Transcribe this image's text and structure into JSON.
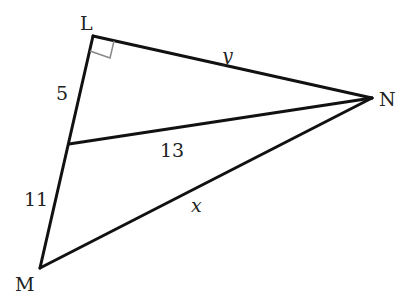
{
  "diagram": {
    "type": "geometry-triangle",
    "vertices": {
      "L": {
        "label": "L",
        "x": 93,
        "y": 36
      },
      "M": {
        "label": "M",
        "x": 40,
        "y": 268
      },
      "N": {
        "label": "N",
        "x": 372,
        "y": 98
      }
    },
    "segments": [
      {
        "from": "L",
        "to": "N",
        "label": "y"
      },
      {
        "from": "L",
        "to": "P",
        "label": "5"
      },
      {
        "from": "P",
        "to": "M",
        "label": "11"
      },
      {
        "from": "P",
        "to": "N",
        "label": "13"
      },
      {
        "from": "M",
        "to": "N",
        "label": "x"
      }
    ],
    "point_on_LM": {
      "x": 69,
      "y": 144
    },
    "right_angle_at": "L",
    "labels": {
      "L": "L",
      "M": "M",
      "N": "N",
      "LP": "5",
      "PM": "11",
      "PN": "13",
      "LN": "y",
      "MN": "x"
    },
    "colors": {
      "line": "#111111",
      "right_angle_marker": "#888888",
      "background": "#ffffff"
    }
  }
}
